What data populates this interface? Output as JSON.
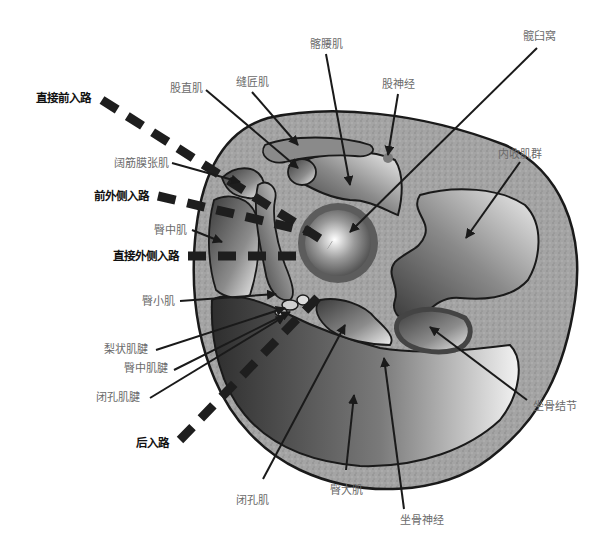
{
  "diagram": {
    "approaches": [
      {
        "id": "direct-anterior",
        "label": "直接前入路"
      },
      {
        "id": "anterolateral",
        "label": "前外侧入路"
      },
      {
        "id": "direct-lateral",
        "label": "直接外侧入路"
      },
      {
        "id": "posterior",
        "label": "后入路"
      }
    ],
    "structures": [
      {
        "id": "rectus-femoris",
        "label": "股直肌"
      },
      {
        "id": "sartorius",
        "label": "缝匠肌"
      },
      {
        "id": "iliopsoas",
        "label": "髂腰肌"
      },
      {
        "id": "femoral-nerve",
        "label": "股神经"
      },
      {
        "id": "acetabulum",
        "label": "髋臼窝"
      },
      {
        "id": "tensor-fasciae-latae",
        "label": "阔筋膜张肌"
      },
      {
        "id": "adductors",
        "label": "内收肌群"
      },
      {
        "id": "gluteus-medius",
        "label": "臀中肌"
      },
      {
        "id": "gluteus-minimus",
        "label": "臀小肌"
      },
      {
        "id": "piriformis-tendon",
        "label": "梨状肌腱"
      },
      {
        "id": "gluteus-medius-tendon",
        "label": "臀中肌腱"
      },
      {
        "id": "obturator-tendon",
        "label": "闭孔肌腱"
      },
      {
        "id": "ischial-tuberosity",
        "label": "坐骨结节"
      },
      {
        "id": "obturator",
        "label": "闭孔肌"
      },
      {
        "id": "gluteus-maximus",
        "label": "臀大肌"
      },
      {
        "id": "sciatic-nerve",
        "label": "坐骨神经"
      }
    ],
    "colors": {
      "outline": "#1a1a1a",
      "fat": "#9a9a9a",
      "muscle_dark": "#3c3c3c",
      "muscle_light": "#e8e8e8",
      "dash": "#1e1e1e",
      "label_gray": "#6a6a6a",
      "label_black": "#111111"
    }
  }
}
